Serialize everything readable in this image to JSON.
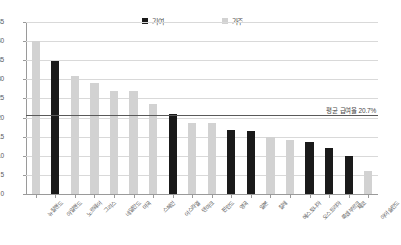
{
  "chart_data": {
    "type": "bar",
    "title": "",
    "xlabel": "",
    "ylabel": "",
    "ylim": [
      0,
      45
    ],
    "ytick_step": 5,
    "yticks": [
      0,
      5,
      10,
      15,
      20,
      25,
      30,
      35,
      40,
      45
    ],
    "ytick_labels": [
      "0",
      "5",
      "10",
      "15",
      "20",
      "25",
      "30",
      "35",
      "40",
      "45"
    ],
    "grid": true,
    "legend_position": "top-center",
    "legend": [
      {
        "name": "기여",
        "color": "#1a1a1a"
      },
      {
        "name": "가주",
        "color": "#d2d2d2"
      }
    ],
    "categories": [
      "뉴질랜드",
      "아일랜드",
      "노르웨이",
      "그리스",
      "네덜란드",
      "미국",
      "스페인",
      "이스라엘",
      "이스라엘",
      "덴마크",
      "핀란드",
      "영국",
      "일본",
      "칠레",
      "에스토니아",
      "체코",
      "오스트리아",
      "룩셈부르크",
      "스웨덴",
      "아이슬란드"
    ],
    "values": [
      40,
      34.8,
      31,
      29,
      27,
      27,
      23.5,
      21,
      18.5,
      18.5,
      17,
      16.5,
      16.5,
      15,
      14,
      13.5,
      12,
      10,
      9.5,
      6
    ],
    "series_assignment": [
      "가주",
      "기여",
      "가주",
      "가주",
      "가주",
      "가주",
      "가주",
      "기여",
      "가주",
      "가주",
      "기여",
      "기여",
      "가주",
      "가주",
      "기여",
      "기여",
      "기여",
      "가주"
    ],
    "bars": [
      {
        "label": "뉴질랜드",
        "value": 40,
        "series": "가주"
      },
      {
        "label": "아일랜드",
        "value": 34.8,
        "series": "기여"
      },
      {
        "label": "노르웨이",
        "value": 31,
        "series": "가주"
      },
      {
        "label": "그리스",
        "value": 29,
        "series": "가주"
      },
      {
        "label": "네덜란드",
        "value": 27,
        "series": "가주"
      },
      {
        "label": "미국",
        "value": 27,
        "series": "가주"
      },
      {
        "label": "스페인",
        "value": 23.5,
        "series": "가주"
      },
      {
        "label": "이스라엘",
        "value": 21,
        "series": "기여"
      },
      {
        "label": "덴마크",
        "value": 18.5,
        "series": "가주"
      },
      {
        "label": "핀란드",
        "value": 18.5,
        "series": "가주"
      },
      {
        "label": "영국",
        "value": 16.7,
        "series": "기여"
      },
      {
        "label": "일본",
        "value": 16.5,
        "series": "기여"
      },
      {
        "label": "칠레",
        "value": 15,
        "series": "가주"
      },
      {
        "label": "에스토니아",
        "value": 14.2,
        "series": "가주"
      },
      {
        "label": "오스트리아",
        "value": 13.5,
        "series": "기여"
      },
      {
        "label": "룩셈부르크",
        "value": 12,
        "series": "기여"
      },
      {
        "label": "체코",
        "value": 10,
        "series": "기여"
      },
      {
        "label": "아이슬란드",
        "value": 6,
        "series": "가주"
      }
    ],
    "reference_line": {
      "value": 20.7,
      "label": "평균 급여율 20.7%",
      "color": "#595959"
    },
    "colors": {
      "series_dark": "#1a1a1a",
      "series_light": "#d2d2d2",
      "gridline": "#d9d9d9",
      "axis": "#9a9a9a",
      "text": "#4a4a4a",
      "background": "#ffffff"
    }
  }
}
